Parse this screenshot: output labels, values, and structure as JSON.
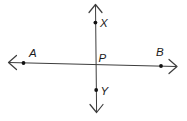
{
  "figure": {
    "background_color": "#ffffff",
    "line_color": "#3d3d3d",
    "point_color": "#111111",
    "label_color": "#1c1c1c",
    "labels": {
      "a": "A",
      "b": "B",
      "x": "X",
      "y": "Y",
      "p": "P"
    }
  }
}
